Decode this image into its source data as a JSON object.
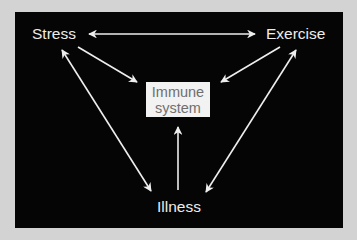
{
  "diagram": {
    "background_color": "#d3d3d3",
    "panel_color": "#050505",
    "node_text_color": "#ececec",
    "box_fill": "#f2f2f2",
    "box_text_color": "#6f6f6f",
    "arrow_color": "#eeeeee",
    "nodes": {
      "stress": "Stress",
      "exercise": "Exercise",
      "illness": "Illness",
      "immune_line1": "Immune",
      "immune_line2": "system"
    },
    "edges": [
      {
        "from": "Stress",
        "to": "Exercise",
        "direction": "both"
      },
      {
        "from": "Stress",
        "to": "Immune system",
        "direction": "forward"
      },
      {
        "from": "Exercise",
        "to": "Immune system",
        "direction": "forward"
      },
      {
        "from": "Illness",
        "to": "Immune system",
        "direction": "forward"
      },
      {
        "from": "Stress",
        "to": "Illness",
        "direction": "both"
      },
      {
        "from": "Exercise",
        "to": "Illness",
        "direction": "both"
      }
    ]
  }
}
